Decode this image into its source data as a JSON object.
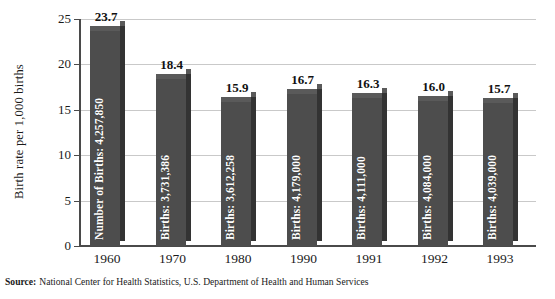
{
  "chart_data": {
    "type": "bar",
    "title": "",
    "xlabel": "",
    "ylabel": "Birth rate per 1,000 births",
    "categories": [
      "1960",
      "1970",
      "1980",
      "1990",
      "1991",
      "1992",
      "1993"
    ],
    "values": [
      23.7,
      18.4,
      15.9,
      16.7,
      16.3,
      16.0,
      15.7
    ],
    "value_labels": [
      "23.7",
      "18.4",
      "15.9",
      "16.7",
      "16.3",
      "16.0",
      "15.7"
    ],
    "bar_annotations": [
      "Number of Births: 4,257,850",
      "Births: 3,731,386",
      "Births: 3,612,258",
      "Births: 4,179,000",
      "Births: 4,111,000",
      "Births: 4,084,000",
      "Births: 4,039,000"
    ],
    "births_counts": [
      4257850,
      3731386,
      3612258,
      4179000,
      4111000,
      4084000,
      4039000
    ],
    "ylim": [
      0,
      25
    ],
    "ytick_labels": [
      "0",
      "5",
      "10",
      "15",
      "20",
      "25"
    ],
    "ytick_values": [
      0,
      5,
      10,
      15,
      20,
      25
    ],
    "grid": true,
    "legend": "none",
    "bar_color": "#4d4d4d",
    "bar_side_color": "#333333",
    "bar_top_color": "#5a5a5a",
    "gridline_color": "#c9c9c9",
    "axis_color": "#4a4a4a",
    "annotation_text_color": "#ffffff"
  },
  "source": {
    "label": "Source:",
    "text": "National Center for Health Statistics, U.S. Department of Health and Human Services"
  }
}
